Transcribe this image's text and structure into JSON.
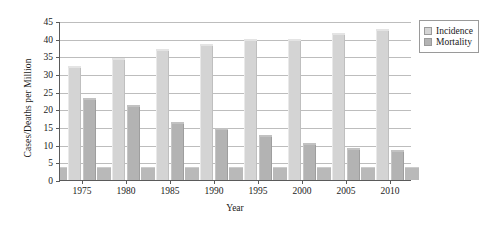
{
  "chart_data": {
    "type": "bar",
    "title": "",
    "xlabel": "Year",
    "ylabel": "Cases/Deaths per Million",
    "categories": [
      "1975",
      "1980",
      "1985",
      "1990",
      "1995",
      "2000",
      "2005",
      "2010"
    ],
    "series": [
      {
        "name": "Incidence",
        "color": "#d4d4d4",
        "values": [
          32.3,
          34.4,
          37.2,
          38.6,
          39.8,
          40.0,
          41.6,
          42.6
        ]
      },
      {
        "name": "Mortality",
        "color": "#b3b3b3",
        "values": [
          23.2,
          21.2,
          16.4,
          14.6,
          12.8,
          10.6,
          9.1,
          8.6
        ]
      }
    ],
    "ylim": [
      0,
      45
    ],
    "yticks": [
      0,
      5,
      10,
      15,
      20,
      25,
      30,
      35,
      40,
      45
    ],
    "ytick_labels": [
      "0",
      "5",
      "10",
      "15",
      "20",
      "25",
      "30",
      "35",
      "40",
      "45"
    ],
    "grid": true,
    "legend_position": "right-top",
    "legend": [
      "Incidence",
      "Mortality"
    ]
  },
  "legend": {
    "items": [
      {
        "label": "Incidence",
        "swatch": "legend-swatch-incidence"
      },
      {
        "label": "Mortality",
        "swatch": "legend-swatch-mortality"
      }
    ]
  }
}
